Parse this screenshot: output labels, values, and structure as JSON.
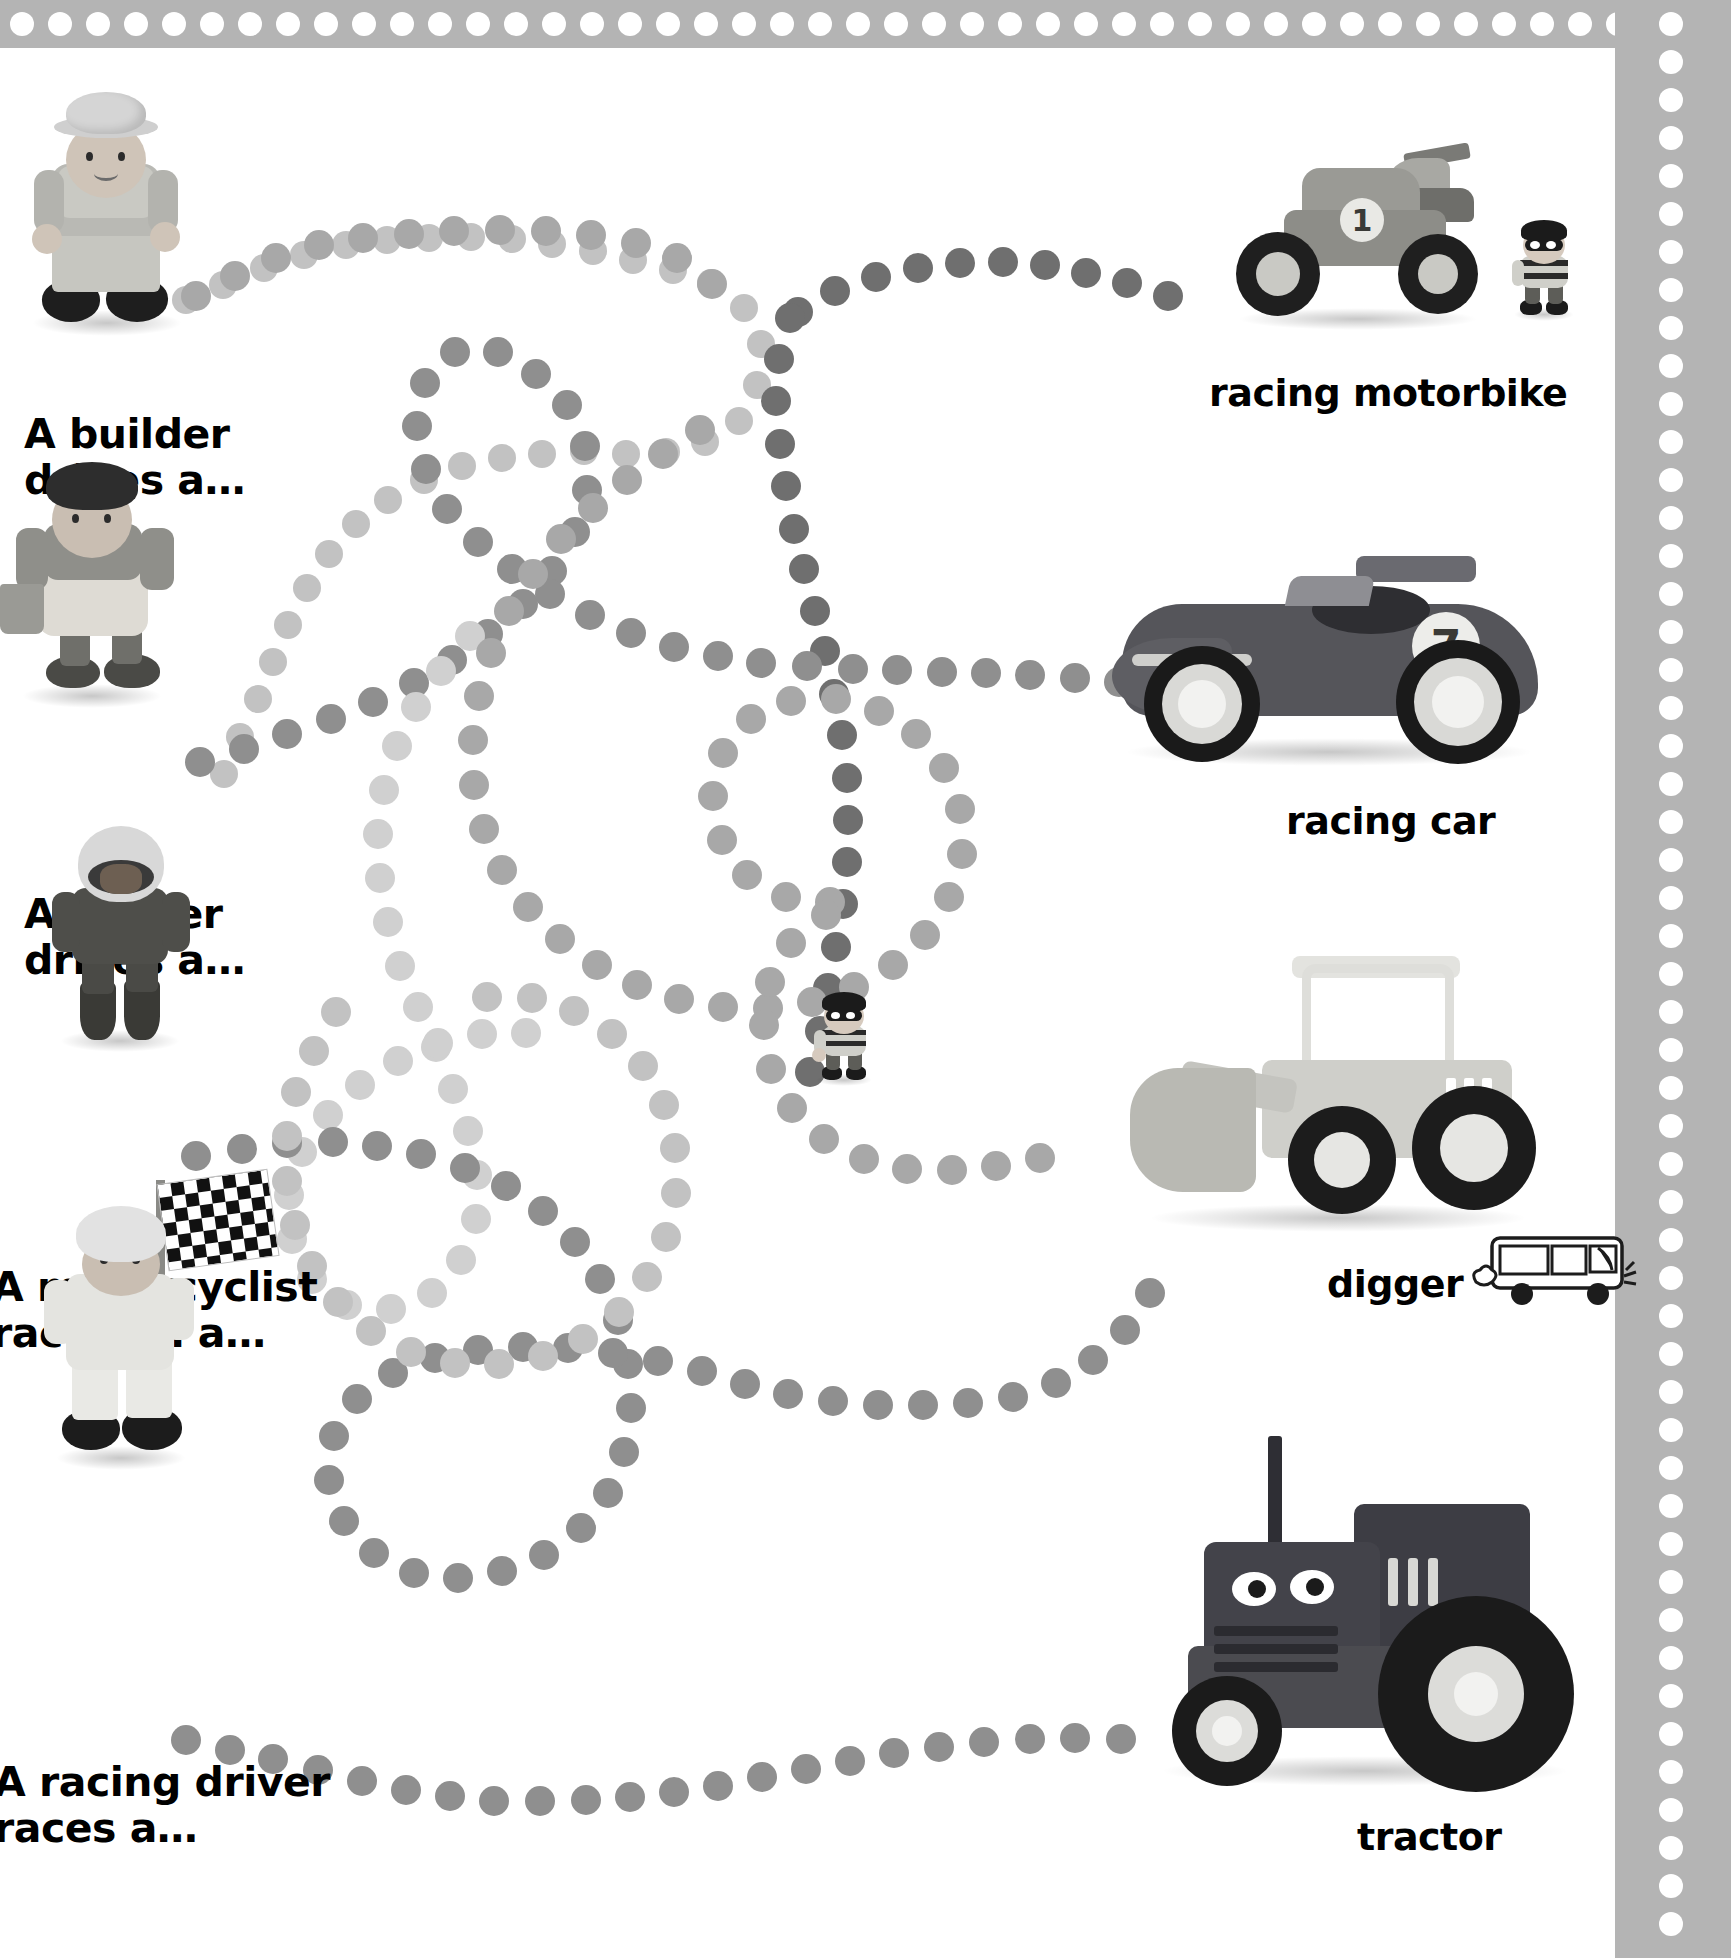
{
  "page": {
    "type": "childrens-activity-matching-page",
    "background_color": "#ffffff",
    "border_color": "#b4b4b4",
    "border_dot_color": "#ffffff",
    "text_color": "#000000"
  },
  "left_column": {
    "items": [
      {
        "id": "builder",
        "label": "A builder\ndrives a…",
        "figure_name": "wooden-toy-builder-figure",
        "clipped_at_left": false
      },
      {
        "id": "farmer",
        "label": "A farmer\ndrives a…",
        "figure_name": "wooden-toy-farmer-figure",
        "clipped_at_left": true
      },
      {
        "id": "motorcyclist",
        "label": "A motorcyclist\nraces on a…",
        "figure_name": "wooden-toy-motorcyclist-figure",
        "clipped_at_left": true
      },
      {
        "id": "racing-driver",
        "label": "A racing driver\nraces a…",
        "figure_name": "wooden-toy-racing-driver-figure",
        "clipped_at_left": true
      }
    ]
  },
  "right_column": {
    "items": [
      {
        "id": "racing-motorbike",
        "label": "racing motorbike",
        "figure_name": "wooden-toy-racing-motorbike",
        "number_decal": "1"
      },
      {
        "id": "racing-car",
        "label": "racing car",
        "figure_name": "wooden-toy-racing-car",
        "number_decal": "7"
      },
      {
        "id": "digger",
        "label": "digger",
        "figure_name": "wooden-toy-digger"
      },
      {
        "id": "tractor",
        "label": "tractor",
        "figure_name": "wooden-toy-tractor"
      }
    ]
  },
  "extra_figures": [
    {
      "id": "burglar-small",
      "figure_name": "wooden-toy-burglar-figure",
      "position": "beside-racing-motorbike"
    },
    {
      "id": "burglar-center",
      "figure_name": "wooden-toy-burglar-figure",
      "position": "page-centre"
    },
    {
      "id": "doodle-bus",
      "figure_name": "line-drawn-bus-doodle",
      "position": "right-of-digger-label"
    }
  ],
  "trails": {
    "description": "dotted paths connecting the left figures to the right vehicles",
    "dot_colors": [
      "#8f8f8f",
      "#a8a8a8",
      "#c2c2c2",
      "#6f6f6f",
      "#d0d0d0"
    ],
    "paths": [
      {
        "from": "builder",
        "to": "racing-motorbike"
      },
      {
        "from": "farmer",
        "to": "racing-car"
      },
      {
        "from": "motorcyclist",
        "to": "digger"
      },
      {
        "from": "racing-driver",
        "to": "tractor"
      }
    ]
  }
}
